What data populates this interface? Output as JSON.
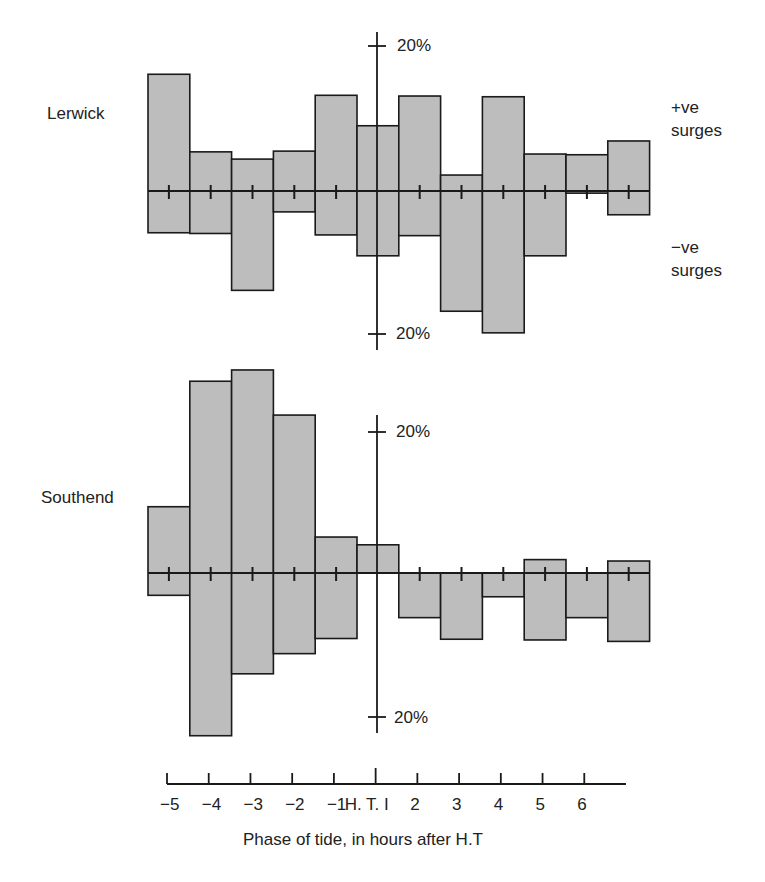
{
  "figure": {
    "panels": [
      {
        "name": "Lerwick",
        "label": "Lerwick"
      },
      {
        "name": "Southend",
        "label": "Southend"
      }
    ],
    "side_labels": {
      "positive_line1": "+ve",
      "positive_line2": "surges",
      "negative_line1": "−ve",
      "negative_line2": "surges"
    },
    "scale_labels": {
      "top_upper": "20%",
      "top_lower": "20%",
      "bottom_upper": "20%",
      "bottom_lower": "20%"
    },
    "x_tick_labels": [
      "−5",
      "−4",
      "−3",
      "−2",
      "−1",
      "H. T. I",
      "2",
      "3",
      "4",
      "5",
      "6"
    ],
    "x_axis_title": "Phase of tide, in hours after H.T",
    "colors": {
      "bar_fill": "#bdbdbd",
      "line": "#1a1a1a"
    }
  },
  "chart_data": [
    {
      "type": "bar",
      "title": "Lerwick",
      "xlabel": "Phase of tide, in hours after H.T",
      "ylabel": "Frequency of surges (%)",
      "categories": [
        "-5",
        "-4",
        "-3",
        "-2",
        "-1",
        "HT",
        "1",
        "2",
        "3",
        "4",
        "5",
        "6"
      ],
      "series": [
        {
          "name": "+ve surges",
          "values": [
            16.1,
            5.4,
            4.4,
            5.5,
            13.2,
            9.0,
            13.1,
            2.2,
            13.0,
            5.1,
            5.0,
            6.9
          ]
        },
        {
          "name": "-ve surges",
          "values": [
            5.8,
            5.9,
            13.8,
            2.9,
            6.1,
            9.0,
            6.2,
            16.7,
            19.7,
            9.0,
            0.3,
            3.3
          ]
        }
      ],
      "scale_reference": "20%",
      "ylim": [
        -20,
        20
      ],
      "grid": false,
      "legend": "right-side labels (+ve surges above axis, -ve surges below)"
    },
    {
      "type": "bar",
      "title": "Southend",
      "xlabel": "Phase of tide, in hours after H.T",
      "ylabel": "Frequency of surges (%)",
      "categories": [
        "-5",
        "-4",
        "-3",
        "-2",
        "-1",
        "HT",
        "1",
        "2",
        "3",
        "4",
        "5",
        "6"
      ],
      "series": [
        {
          "name": "+ve surges",
          "values": [
            9.4,
            27.2,
            28.8,
            22.4,
            5.1,
            4.0,
            0,
            0,
            0,
            1.9,
            0,
            1.7
          ]
        },
        {
          "name": "-ve surges",
          "values": [
            3.1,
            22.6,
            14.0,
            11.2,
            9.1,
            0,
            6.2,
            9.2,
            3.3,
            9.3,
            6.2,
            9.5
          ]
        }
      ],
      "scale_reference": "20%",
      "ylim": [
        -25,
        30
      ],
      "grid": false
    }
  ]
}
